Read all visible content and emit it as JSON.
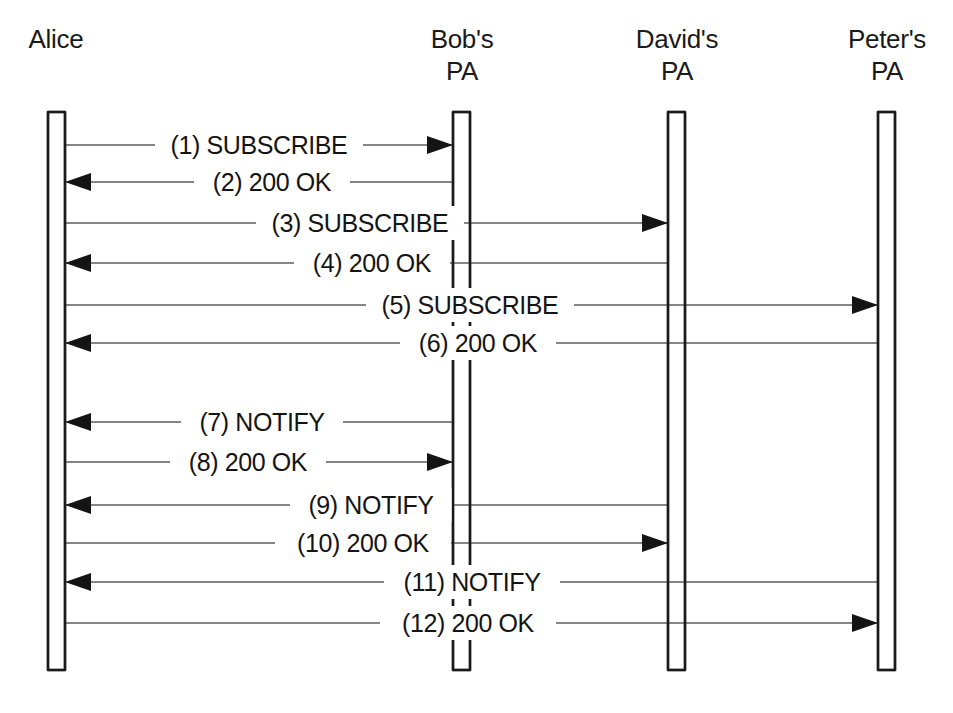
{
  "diagram": {
    "type": "uml-sequence-diagram",
    "title": "",
    "background_color": "#ffffff",
    "line_color": "#5d5d5d",
    "text_color": "#141414",
    "lifeline_stroke_color": "#1a1a1a",
    "actors": [
      {
        "id": "alice",
        "label_lines": [
          "Alice"
        ],
        "label_x": 56,
        "label_top_y": 48,
        "box_x": 48,
        "box_width": 17,
        "box_top": 112,
        "box_bottom": 670
      },
      {
        "id": "bobs-pa",
        "label_lines": [
          "Bob's",
          "PA"
        ],
        "label_x": 462,
        "label_top_y": 48,
        "box_x": 453,
        "box_width": 17,
        "box_top": 112,
        "box_bottom": 670
      },
      {
        "id": "davids-pa",
        "label_lines": [
          "David's",
          "PA"
        ],
        "label_x": 677,
        "label_top_y": 48,
        "box_x": 668,
        "box_width": 17,
        "box_top": 112,
        "box_bottom": 670
      },
      {
        "id": "peters-pa",
        "label_lines": [
          "Peter's",
          "PA"
        ],
        "label_x": 887,
        "label_top_y": 48,
        "box_x": 878,
        "box_width": 17,
        "box_top": 112,
        "box_bottom": 670
      }
    ],
    "messages": [
      {
        "seq": 1,
        "number_label": "(1)",
        "method": "SUBSCRIBE",
        "label": "(1) SUBSCRIBE",
        "from": "alice",
        "to": "bobs-pa",
        "direction": "right",
        "y": 145,
        "label_center_x": 259,
        "label_half_width": 98
      },
      {
        "seq": 2,
        "number_label": "(2)",
        "method": "200 OK",
        "label": "(2) 200 OK",
        "from": "bobs-pa",
        "to": "alice",
        "direction": "left",
        "y": 182,
        "label_center_x": 272,
        "label_half_width": 72
      },
      {
        "seq": 3,
        "number_label": "(3)",
        "method": "SUBSCRIBE",
        "label": "(3) SUBSCRIBE",
        "from": "alice",
        "to": "davids-pa",
        "direction": "right",
        "y": 223,
        "label_center_x": 360,
        "label_half_width": 98
      },
      {
        "seq": 4,
        "number_label": "(4)",
        "method": "200 OK",
        "label": "(4) 200 OK",
        "from": "davids-pa",
        "to": "alice",
        "direction": "left",
        "y": 263,
        "label_center_x": 372,
        "label_half_width": 72
      },
      {
        "seq": 5,
        "number_label": "(5)",
        "method": "SUBSCRIBE",
        "label": "(5) SUBSCRIBE",
        "from": "alice",
        "to": "peters-pa",
        "direction": "right",
        "y": 305,
        "label_center_x": 470,
        "label_half_width": 98
      },
      {
        "seq": 6,
        "number_label": "(6)",
        "method": "200 OK",
        "label": "(6) 200 OK",
        "from": "peters-pa",
        "to": "alice",
        "direction": "left",
        "y": 343,
        "label_center_x": 478,
        "label_half_width": 72
      },
      {
        "seq": 7,
        "number_label": "(7)",
        "method": "NOTIFY",
        "label": "(7) NOTIFY",
        "from": "bobs-pa",
        "to": "alice",
        "direction": "left",
        "y": 422,
        "label_center_x": 262,
        "label_half_width": 75
      },
      {
        "seq": 8,
        "number_label": "(8)",
        "method": "200 OK",
        "label": "(8) 200 OK",
        "from": "alice",
        "to": "bobs-pa",
        "direction": "right",
        "y": 462,
        "label_center_x": 248,
        "label_half_width": 72
      },
      {
        "seq": 9,
        "number_label": "(9)",
        "method": "NOTIFY",
        "label": "(9) NOTIFY",
        "from": "davids-pa",
        "to": "alice",
        "direction": "left",
        "y": 505,
        "label_center_x": 371,
        "label_half_width": 75
      },
      {
        "seq": 10,
        "number_label": "(10)",
        "method": "200 OK",
        "label": "(10) 200 OK",
        "from": "alice",
        "to": "davids-pa",
        "direction": "right",
        "y": 543,
        "label_center_x": 363,
        "label_half_width": 82
      },
      {
        "seq": 11,
        "number_label": "(11)",
        "method": "NOTIFY",
        "label": "(11) NOTIFY",
        "from": "peters-pa",
        "to": "alice",
        "direction": "left",
        "y": 582,
        "label_center_x": 472,
        "label_half_width": 82
      },
      {
        "seq": 12,
        "number_label": "(12)",
        "method": "200 OK",
        "label": "(12) 200 OK",
        "from": "alice",
        "to": "peters-pa",
        "direction": "right",
        "y": 623,
        "label_center_x": 468,
        "label_half_width": 82
      }
    ]
  }
}
